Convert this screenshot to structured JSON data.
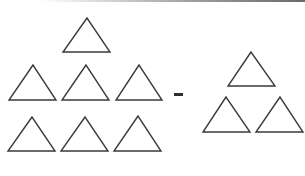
{
  "diagram": {
    "operator": "minus",
    "stroke_color": "#3a3a3a",
    "fill_color": "#ffffff",
    "left_group": {
      "count": 7,
      "triangles": [
        {
          "apex": [
            87,
            18
          ],
          "base_left": [
            63,
            52
          ],
          "base_right": [
            110,
            52
          ]
        },
        {
          "apex": [
            33,
            65
          ],
          "base_left": [
            9,
            100
          ],
          "base_right": [
            56,
            100
          ]
        },
        {
          "apex": [
            86,
            65
          ],
          "base_left": [
            62,
            100
          ],
          "base_right": [
            109,
            100
          ]
        },
        {
          "apex": [
            139,
            65
          ],
          "base_left": [
            116,
            100
          ],
          "base_right": [
            162,
            100
          ]
        },
        {
          "apex": [
            32,
            117
          ],
          "base_left": [
            8,
            151
          ],
          "base_right": [
            55,
            151
          ]
        },
        {
          "apex": [
            85,
            117
          ],
          "base_left": [
            61,
            151
          ],
          "base_right": [
            108,
            151
          ]
        },
        {
          "apex": [
            138,
            116
          ],
          "base_left": [
            114,
            151
          ],
          "base_right": [
            161,
            151
          ]
        }
      ]
    },
    "minus_sign": {
      "x": 174,
      "y": 93,
      "width": 9,
      "height": 3
    },
    "right_group": {
      "count": 3,
      "triangles": [
        {
          "apex": [
            251,
            52
          ],
          "base_left": [
            228,
            86
          ],
          "base_right": [
            275,
            86
          ]
        },
        {
          "apex": [
            226,
            97
          ],
          "base_left": [
            203,
            132
          ],
          "base_right": [
            250,
            132
          ]
        },
        {
          "apex": [
            280,
            97
          ],
          "base_left": [
            256,
            132
          ],
          "base_right": [
            303,
            132
          ]
        }
      ]
    }
  }
}
